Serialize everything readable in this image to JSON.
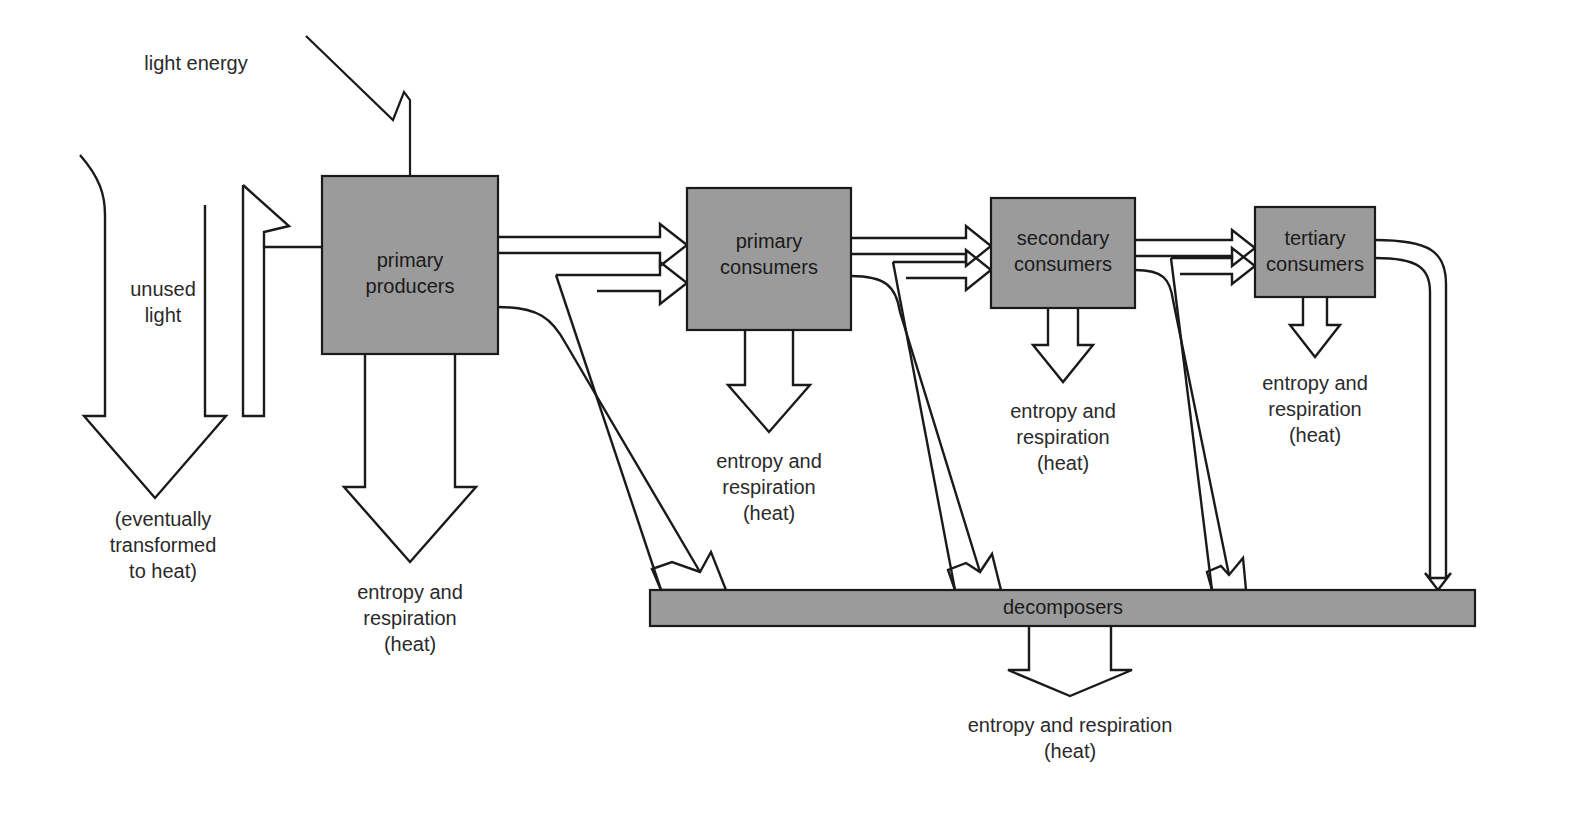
{
  "diagram": {
    "background_color": "#ffffff",
    "box_fill_color": "#9b9b9b",
    "stroke_color": "#1a1a1a",
    "text_color": "#1a1a1a"
  },
  "nodes": {
    "primary_producers": {
      "line1": "primary",
      "line2": "producers"
    },
    "primary_consumers": {
      "line1": "primary",
      "line2": "consumers"
    },
    "secondary_consumers": {
      "line1": "secondary",
      "line2": "consumers"
    },
    "tertiary_consumers": {
      "line1": "tertiary",
      "line2": "consumers"
    },
    "decomposers": {
      "label": "decomposers"
    }
  },
  "captions": {
    "light_energy": {
      "line1": "light energy"
    },
    "unused_light": {
      "line1": "unused",
      "line2": "light"
    },
    "eventually_heat": {
      "line1": "(eventually",
      "line2": "transformed",
      "line3": "to heat)"
    },
    "producers_heat": {
      "line1": "entropy and",
      "line2": "respiration",
      "line3": "(heat)"
    },
    "primary_consumers_heat": {
      "line1": "entropy and",
      "line2": "respiration",
      "line3": "(heat)"
    },
    "secondary_consumers_heat": {
      "line1": "entropy and",
      "line2": "respiration",
      "line3": "(heat)"
    },
    "tertiary_consumers_heat": {
      "line1": "entropy and",
      "line2": "respiration",
      "line3": "(heat)"
    },
    "decomposers_heat": {
      "line1": "entropy and respiration",
      "line2": "(heat)"
    }
  }
}
